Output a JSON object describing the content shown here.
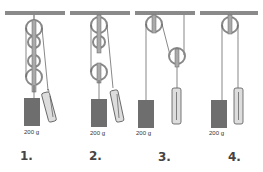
{
  "diagram": {
    "title": "",
    "type": "pulley systems",
    "panels": [
      {
        "number": "1.",
        "mass_label": "200 g",
        "pulleys": 4,
        "description": "block and tackle with four pulleys, spring scale on free rope end"
      },
      {
        "number": "2.",
        "mass_label": "200 g",
        "pulleys": 3,
        "description": "block and tackle with three pulleys, spring scale on free rope end"
      },
      {
        "number": "3.",
        "mass_label": "200 g",
        "pulleys": 2,
        "description": "fixed pulley and movable pulley, spring scale hanging from movable pulley"
      },
      {
        "number": "4.",
        "mass_label": "200 g",
        "pulleys": 1,
        "description": "single fixed pulley, spring scale on rope end"
      }
    ],
    "colors": {
      "ceiling": "#8a8a8a",
      "pulley": "#b8b8b8",
      "mass": "#6e6e6e",
      "scale": "#d8d8d8",
      "rope": "#555555"
    }
  }
}
